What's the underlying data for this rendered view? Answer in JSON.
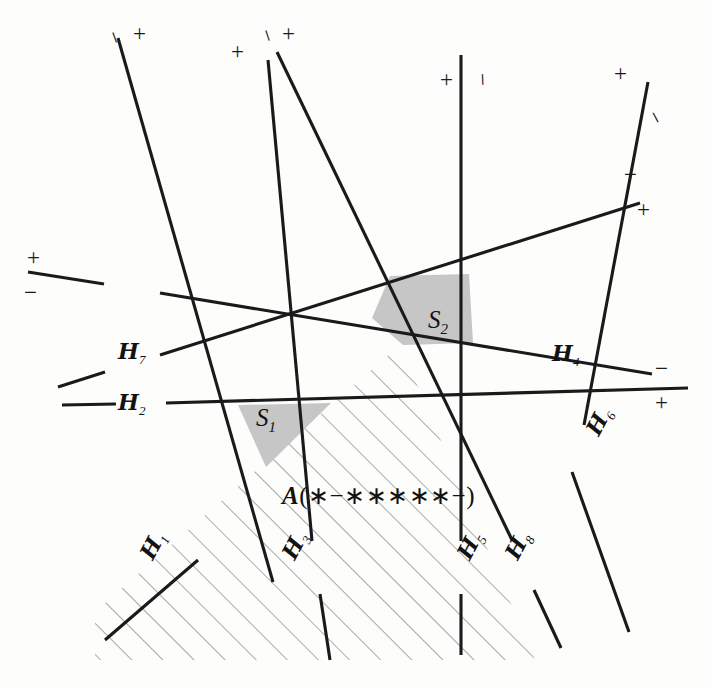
{
  "figure": {
    "type": "hyperplane-arrangement-diagram",
    "background_color": "#fdfdfc",
    "line_color": "#1a1a1a",
    "shade_color": "#c6c6c6",
    "hatch_color": "#8d8d8d",
    "width": 711,
    "height": 687
  },
  "hyperplane_labels": [
    {
      "id": "h7",
      "text": "H",
      "sub": "7",
      "x": 123,
      "y": 352,
      "rotate": 0
    },
    {
      "id": "h2",
      "text": "H",
      "sub": "2",
      "x": 123,
      "y": 398,
      "rotate": 0
    },
    {
      "id": "h4",
      "text": "H",
      "sub": "4",
      "x": 555,
      "y": 353,
      "rotate": 0
    },
    {
      "id": "h6",
      "text": "H",
      "sub": "6",
      "x": 586,
      "y": 437,
      "rotate": -62
    },
    {
      "id": "h1",
      "text": "H",
      "sub": "1",
      "x": 138,
      "y": 560,
      "rotate": -62
    },
    {
      "id": "h3",
      "text": "H",
      "sub": "3",
      "x": 280,
      "y": 560,
      "rotate": -62
    },
    {
      "id": "h5",
      "text": "H",
      "sub": "5",
      "x": 455,
      "y": 560,
      "rotate": -62
    },
    {
      "id": "h8",
      "text": "H",
      "sub": "8",
      "x": 503,
      "y": 560,
      "rotate": -62
    }
  ],
  "sign_labels": [
    {
      "id": "s-h1-top-minus",
      "text": "−",
      "x": 110,
      "y": 28,
      "rotate": 70
    },
    {
      "id": "s-h1-top-plus",
      "text": "+",
      "x": 136,
      "y": 26,
      "rotate": 0
    },
    {
      "id": "s-h3-top-plus",
      "text": "+",
      "x": 234,
      "y": 44,
      "rotate": 0
    },
    {
      "id": "s-h8-top-minus",
      "text": "−",
      "x": 263,
      "y": 28,
      "rotate": 72
    },
    {
      "id": "s-h8-top-plus",
      "text": "+",
      "x": 285,
      "y": 26,
      "rotate": 0
    },
    {
      "id": "s-h5-plus",
      "text": "+",
      "x": 443,
      "y": 73,
      "rotate": 0
    },
    {
      "id": "s-h5-minus",
      "text": "−",
      "x": 478,
      "y": 73,
      "rotate": 88
    },
    {
      "id": "s-h6-plus",
      "text": "+",
      "x": 617,
      "y": 66,
      "rotate": 0
    },
    {
      "id": "s-h6-minus",
      "text": "−",
      "x": 652,
      "y": 110,
      "rotate": 62
    },
    {
      "id": "s-h7-minus",
      "text": "−",
      "x": 627,
      "y": 170,
      "rotate": 0
    },
    {
      "id": "s-h7-plus",
      "text": "+",
      "x": 640,
      "y": 205,
      "rotate": 0
    },
    {
      "id": "s-h4-plus",
      "text": "+",
      "x": 30,
      "y": 252,
      "rotate": 0
    },
    {
      "id": "s-h4-minus",
      "text": "−",
      "x": 27,
      "y": 288,
      "rotate": 0
    },
    {
      "id": "s-h2-minus",
      "text": "−",
      "x": 658,
      "y": 363,
      "rotate": 0
    },
    {
      "id": "s-h2-plus",
      "text": "+",
      "x": 658,
      "y": 397,
      "rotate": 0
    }
  ],
  "region_labels": [
    {
      "id": "s1",
      "text": "S",
      "sub": "1",
      "x": 258,
      "y": 416
    },
    {
      "id": "s2",
      "text": "S",
      "sub": "2",
      "x": 430,
      "y": 318
    }
  ],
  "annotation": {
    "id": "covector-annotation",
    "prefix": "A",
    "open": "(",
    "signs": "∗−∗∗∗∗∗−",
    "close": ")",
    "full_text": "A(∗−∗∗∗∗∗−)",
    "x": 284,
    "y": 493
  },
  "geometry": {
    "lines": [
      {
        "id": "line-h1",
        "x1": 118,
        "y1": 38,
        "x2": 273,
        "y2": 582,
        "note": "steep down-right, label H1 bottom-left / top-left signs"
      },
      {
        "id": "line-h3",
        "x1": 268,
        "y1": 60,
        "x2": 112,
        "y2": 628,
        "note": "steep down-left"
      },
      {
        "id": "line-h8",
        "x1": 277,
        "y1": 52,
        "x2": 519,
        "y2": 643,
        "note": "steep down-right to H8"
      },
      {
        "id": "line-h5",
        "x1": 461,
        "y1": 55,
        "x2": 461,
        "y2": 643,
        "note": "vertical"
      },
      {
        "id": "line-h6",
        "x1": 648,
        "y1": 82,
        "x2": 462,
        "y2": 638,
        "note": "down-left through H6"
      },
      {
        "id": "line-h7",
        "x1": 637,
        "y1": 205,
        "x2": 75,
        "y2": 383,
        "note": "shallow, left end near H7 label"
      },
      {
        "id": "line-h4",
        "x1": 28,
        "y1": 272,
        "x2": 650,
        "y2": 372,
        "note": "shallow rising to the right, H4"
      },
      {
        "id": "line-h2",
        "x1": 62,
        "y1": 404,
        "x2": 683,
        "y2": 387,
        "note": "near-horizontal, H2"
      }
    ],
    "shaded_regions": [
      {
        "id": "region-s1",
        "points": "238,404 330,404 268,466"
      },
      {
        "id": "region-s2",
        "points": "391,275 470,274 472,342 404,344 374,317"
      }
    ],
    "hatched_cone": {
      "id": "region-A",
      "points": "400,345 530,643 110,643 110,600",
      "hatch_angle": 45,
      "hatch_spacing": 22
    }
  }
}
